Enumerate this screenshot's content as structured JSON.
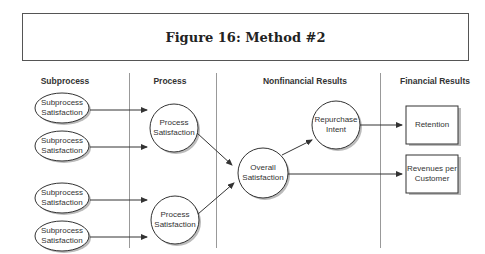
{
  "title": "Figure 16: Method #2",
  "columns": [
    {
      "label": "Subprocess"
    },
    {
      "label": "Process"
    },
    {
      "label": "Nonfinancial Results"
    },
    {
      "label": "Financial Results"
    }
  ],
  "nodes": {
    "subprocess": [
      {
        "line1": "Subprocess",
        "line2": "Satisfaction"
      },
      {
        "line1": "Subprocess",
        "line2": "Satisfaction"
      },
      {
        "line1": "Subprocess",
        "line2": "Satisfaction"
      },
      {
        "line1": "Subprocess",
        "line2": "Satisfaction"
      }
    ],
    "process": [
      {
        "line1": "Process",
        "line2": "Satisfaction"
      },
      {
        "line1": "Process",
        "line2": "Satisfaction"
      }
    ],
    "overall": {
      "line1": "Overall",
      "line2": "Satisfaction"
    },
    "repurchase": {
      "line1": "Repurchase",
      "line2": "Intent"
    },
    "retention": {
      "line1": "Retention"
    },
    "revenues": {
      "line1": "Revenues per",
      "line2": "Customer"
    }
  }
}
